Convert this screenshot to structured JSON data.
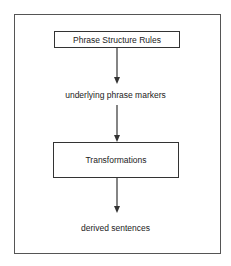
{
  "diagram": {
    "type": "flowchart",
    "nodes": [
      {
        "id": "psr",
        "label": "Phrase Structure Rules",
        "shape": "box"
      },
      {
        "id": "upm",
        "label": "underlying phrase markers",
        "shape": "text"
      },
      {
        "id": "trans",
        "label": "Transformations",
        "shape": "box"
      },
      {
        "id": "ds",
        "label": "derived sentences",
        "shape": "text"
      }
    ],
    "edges": [
      {
        "from": "psr",
        "to": "upm"
      },
      {
        "from": "upm",
        "to": "trans"
      },
      {
        "from": "trans",
        "to": "ds"
      }
    ],
    "colors": {
      "line": "#333333",
      "frame": "#555555",
      "background": "#ffffff"
    }
  }
}
